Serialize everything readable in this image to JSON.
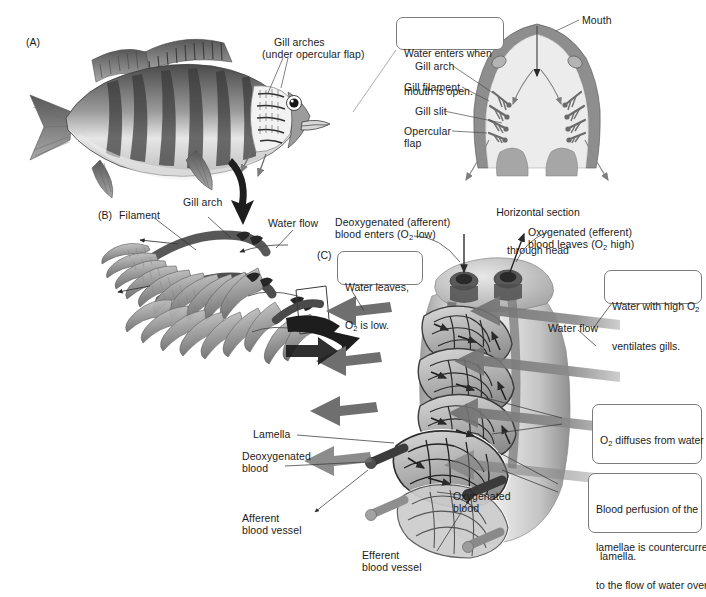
{
  "figure": {
    "background_color": "#ffffff",
    "ink_color": "#1b1b1b",
    "callout_border_color": "#7b7b7b"
  },
  "panels": {
    "a": {
      "id": "(A)",
      "subject": "whole perch fish, lateral view"
    },
    "b": {
      "id": "(B)",
      "subject": "gill arch with filaments"
    },
    "c": {
      "id": "(C)",
      "subject": "single gill filament with lamellae"
    }
  },
  "panel_a": {
    "label_gill_arches_line1": "Gill arches",
    "label_gill_arches_line2": "(under opercular flap)"
  },
  "panel_head": {
    "callout_water_enters_line1": "Water enters when",
    "callout_water_enters_line2": "mouth is open.",
    "label_mouth": "Mouth",
    "label_gill_arch": "Gill arch",
    "label_gill_filament": "Gill filament",
    "label_gill_slit": "Gill slit",
    "label_opercular_line1": "Opercular",
    "label_opercular_line2": "flap",
    "caption_line1": "Horizontal section",
    "caption_line2": "through head"
  },
  "panel_b": {
    "label_filament": "Filament",
    "label_gill_arch": "Gill arch",
    "label_water_flow": "Water flow"
  },
  "panel_c": {
    "label_deoxy_line1": "Deoxygenated (afferent)",
    "label_deoxy_line2_pre": "blood enters (O",
    "label_deoxy_line2_sub": "2",
    "label_deoxy_line2_post": " low)",
    "label_oxy_line1": "Oxygenated (efferent)",
    "label_oxy_line2_pre": "blood leaves (O",
    "label_oxy_line2_sub": "2",
    "label_oxy_line2_post": " high)",
    "callout_water_leaves_line1": "Water leaves,",
    "callout_water_leaves_line2_pre": "O",
    "callout_water_leaves_line2_sub": "2",
    "callout_water_leaves_line2_post": " is low.",
    "callout_high_o2_line1_pre": "Water with high O",
    "callout_high_o2_line1_sub": "2",
    "callout_high_o2_line2": "ventilates gills.",
    "label_water_flow": "Water flow",
    "callout_diffusion_line1_pre": "O",
    "callout_diffusion_line1_sub": "2",
    "callout_diffusion_line1_post": " diffuses from water",
    "callout_diffusion_line2": "into the blood over",
    "callout_diffusion_line3": "the entire length of a",
    "callout_diffusion_line4": "lamella.",
    "callout_countercurrent_line1": "Blood perfusion of the",
    "callout_countercurrent_line2": "lamellae is countercurrent",
    "callout_countercurrent_line3": "to the flow of water over",
    "callout_countercurrent_line4": "the lamellae.",
    "label_lamella": "Lamella",
    "label_deoxy_blood_line1": "Deoxygenated",
    "label_deoxy_blood_line2": "blood",
    "label_afferent_line1": "Afferent",
    "label_afferent_line2": "blood vessel",
    "label_oxy_blood_line1": "Oxygenated",
    "label_oxy_blood_line2": "blood",
    "label_efferent_line1": "Efferent",
    "label_efferent_line2": "blood vessel"
  }
}
